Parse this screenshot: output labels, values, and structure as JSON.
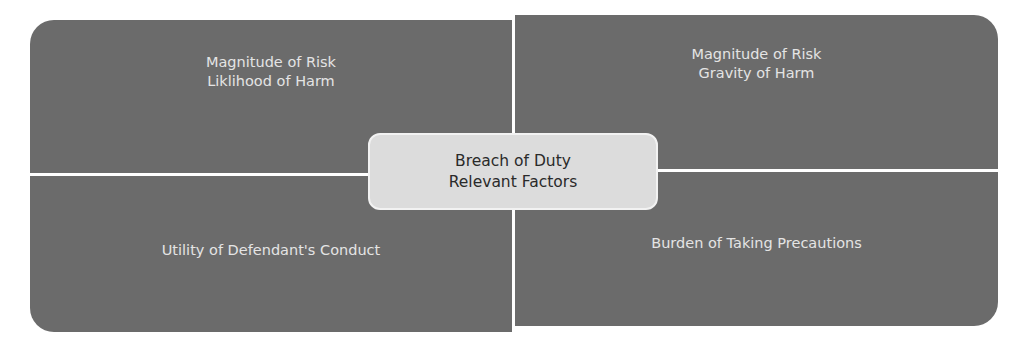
{
  "diagram": {
    "center": {
      "line1": "Breach of Duty",
      "line2": "Relevant Factors"
    },
    "quadrants": {
      "top_left": {
        "line1": "Magnitude of Risk",
        "line2": "Liklihood of Harm"
      },
      "top_right": {
        "line1": "Magnitude of Risk",
        "line2": "Gravity of Harm"
      },
      "bottom_left": {
        "line1": "Utility of Defendant's Conduct"
      },
      "bottom_right": {
        "line1": "Burden of Taking Precautions"
      }
    },
    "colors": {
      "quadrant_fill": "#6b6b6b",
      "quadrant_text": "#e4e4e4",
      "center_fill": "#dcdcdc",
      "center_text": "#2a2a2a"
    }
  }
}
